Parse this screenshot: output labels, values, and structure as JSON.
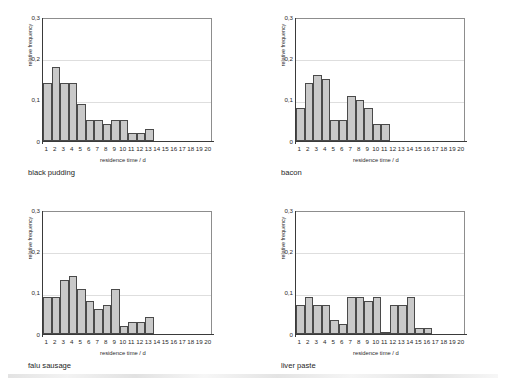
{
  "figure": {
    "background": "#ffffff",
    "bar_fill": "#c9c9c9",
    "bar_stroke": "#4a4a4a",
    "gridline_color": "#dedede",
    "axis_color": "#3a3a3a"
  },
  "axes_common": {
    "xlabel": "residence time / d",
    "ylabel": "relative frequency",
    "ylim": [
      0,
      0.3
    ],
    "xlim": [
      0.5,
      20.5
    ],
    "ytick_labels": [
      "0,3",
      "0,2",
      "0,1",
      "0"
    ],
    "ytick_values": [
      0.3,
      0.2,
      0.1,
      0
    ],
    "xtick_labels": [
      "1",
      "2",
      "3",
      "4",
      "5",
      "6",
      "7",
      "8",
      "9",
      "10",
      "11",
      "12",
      "13",
      "14",
      "15",
      "16",
      "17",
      "18",
      "19",
      "20"
    ],
    "grid": "horizontal"
  },
  "chart_data": [
    {
      "type": "bar",
      "title": "black pudding",
      "xlabel": "residence time / d",
      "ylabel": "relative frequency",
      "ylim": [
        0,
        0.3
      ],
      "categories": [
        1,
        2,
        3,
        4,
        5,
        6,
        7,
        8,
        9,
        10,
        11,
        12,
        13,
        14,
        15,
        16,
        17,
        18,
        19,
        20
      ],
      "values": [
        0.14,
        0.18,
        0.14,
        0.14,
        0.09,
        0.05,
        0.05,
        0.04,
        0.05,
        0.05,
        0.02,
        0.02,
        0.03,
        0,
        0,
        0,
        0,
        0,
        0,
        0
      ]
    },
    {
      "type": "bar",
      "title": "bacon",
      "xlabel": "residence time / d",
      "ylabel": "relative frequency",
      "ylim": [
        0,
        0.3
      ],
      "categories": [
        1,
        2,
        3,
        4,
        5,
        6,
        7,
        8,
        9,
        10,
        11,
        12,
        13,
        14,
        15,
        16,
        17,
        18,
        19,
        20
      ],
      "values": [
        0.08,
        0.14,
        0.16,
        0.15,
        0.05,
        0.05,
        0.11,
        0.1,
        0.08,
        0.04,
        0.04,
        0,
        0,
        0,
        0,
        0,
        0,
        0,
        0,
        0
      ]
    },
    {
      "type": "bar",
      "title": "falu sausage",
      "xlabel": "residence time / d",
      "ylabel": "relative frequency",
      "ylim": [
        0,
        0.3
      ],
      "categories": [
        1,
        2,
        3,
        4,
        5,
        6,
        7,
        8,
        9,
        10,
        11,
        12,
        13,
        14,
        15,
        16,
        17,
        18,
        19,
        20
      ],
      "values": [
        0.09,
        0.09,
        0.13,
        0.14,
        0.11,
        0.08,
        0.06,
        0.07,
        0.11,
        0.02,
        0.03,
        0.03,
        0.04,
        0,
        0,
        0,
        0,
        0,
        0,
        0
      ]
    },
    {
      "type": "bar",
      "title": "liver paste",
      "xlabel": "residence time / d",
      "ylabel": "relative frequency",
      "ylim": [
        0,
        0.3
      ],
      "categories": [
        1,
        2,
        3,
        4,
        5,
        6,
        7,
        8,
        9,
        10,
        11,
        12,
        13,
        14,
        15,
        16,
        17,
        18,
        19,
        20
      ],
      "values": [
        0.07,
        0.09,
        0.07,
        0.07,
        0.035,
        0.025,
        0.09,
        0.09,
        0.08,
        0.09,
        0.005,
        0.07,
        0.07,
        0.09,
        0.015,
        0.015,
        0,
        0,
        0,
        0
      ]
    }
  ]
}
